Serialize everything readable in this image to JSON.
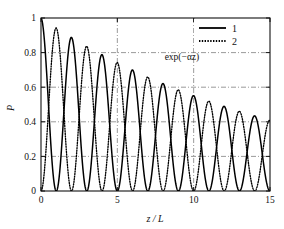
{
  "chart_data": {
    "type": "line",
    "title": "",
    "subtitle": "",
    "xlabel": "z / L",
    "ylabel": "P",
    "xlim": [
      0,
      15
    ],
    "ylim": [
      0,
      1
    ],
    "xticks": [
      0,
      5,
      10,
      15
    ],
    "xticklabels": [
      "0",
      "5",
      "10",
      "15"
    ],
    "yticks": [
      0,
      0.2,
      0.4,
      0.6,
      0.8,
      1
    ],
    "yticklabels": [
      "0",
      "0.2",
      "0.4",
      "0.6",
      "0.8",
      "1"
    ],
    "grid": true,
    "grid_style": "dash-dot",
    "grid_x": [
      5,
      10
    ],
    "grid_y": [
      0.2,
      0.4,
      0.6,
      0.8
    ],
    "legend_position": "top-right",
    "decay_alpha": 0.0596,
    "oscillation_period": 2,
    "series": [
      {
        "name": "1",
        "label": "1",
        "style": "solid",
        "color": "#000000",
        "form": "exp(-alpha*z)*cos(pi*z/2)^2",
        "peaks_x": [
          0,
          2,
          4,
          6,
          8,
          10,
          12,
          14
        ],
        "peaks_y": [
          1.0,
          0.888,
          0.788,
          0.699,
          0.621,
          0.551,
          0.489,
          0.434
        ],
        "zeros_x": [
          1,
          3,
          5,
          7,
          9,
          11,
          13,
          15
        ]
      },
      {
        "name": "2",
        "label": "2",
        "style": "dotted",
        "color": "#000000",
        "form": "exp(-alpha*z)*sin(pi*z/2)^2",
        "peaks_x": [
          1,
          3,
          5,
          7,
          9,
          11,
          13
        ],
        "peaks_y": [
          0.942,
          0.836,
          0.742,
          0.659,
          0.585,
          0.519,
          0.461
        ],
        "zeros_x": [
          0,
          2,
          4,
          6,
          8,
          10,
          12,
          14
        ]
      }
    ],
    "annotations": [
      {
        "name": "envelope-label",
        "text": "exp(−αz)",
        "x": 8.1,
        "y": 0.755,
        "style": "dash-dot",
        "describes": "exponential decay envelope through series 1 peaks"
      }
    ],
    "envelope": {
      "name": "exp(-alpha z)",
      "style": "dash-dot",
      "x": [
        0,
        15
      ],
      "y": [
        1.0,
        0.409
      ]
    }
  },
  "legend": {
    "entries": [
      {
        "label": "1",
        "style": "solid"
      },
      {
        "label": "2",
        "style": "dotted"
      }
    ]
  },
  "axes": {
    "x_title": "z / L",
    "y_title": "P"
  }
}
